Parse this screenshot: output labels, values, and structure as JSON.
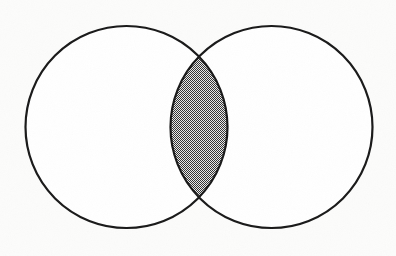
{
  "figure": {
    "name": "two-set-venn-diagram",
    "title": "",
    "caption": "",
    "background_color": "#fcfcfb",
    "stroke_color": "#1b1b1b",
    "stroke_width": 2.2,
    "shade_color": "#757575",
    "shade_pattern": "halftone-dither-50",
    "fill_color": "#ffffff"
  },
  "chart_data": {
    "type": "diagram",
    "subtype": "venn2",
    "title": "",
    "xlabel": "",
    "ylabel": "",
    "canvas": {
      "width": 396,
      "height": 256
    },
    "sets": [
      {
        "id": "A",
        "label": "",
        "center_x": 126.5,
        "center_y": 127,
        "radius": 101,
        "fill": "#ffffff",
        "shaded": false
      },
      {
        "id": "B",
        "label": "",
        "center_x": 271.5,
        "center_y": 127,
        "radius": 101,
        "fill": "#ffffff",
        "shaded": false
      }
    ],
    "regions": [
      {
        "id": "A-only",
        "label": "",
        "shaded": false,
        "fill": "#ffffff"
      },
      {
        "id": "B-only",
        "label": "",
        "shaded": false,
        "fill": "#ffffff"
      },
      {
        "id": "A-and-B",
        "label": "",
        "shaded": true,
        "fill": "#757575",
        "description": "intersection lens shaded",
        "apex_top": {
          "x": 199,
          "y": 52
        },
        "apex_bottom": {
          "x": 199,
          "y": 202
        }
      }
    ],
    "legend": [],
    "annotations": [],
    "grid": false
  },
  "alt_text": {
    "summary": "Two equal overlapping circles forming a Venn diagram; the lens-shaped overlap region in the middle is filled with a dark gray halftone shading while the rest of both circles remains white."
  }
}
